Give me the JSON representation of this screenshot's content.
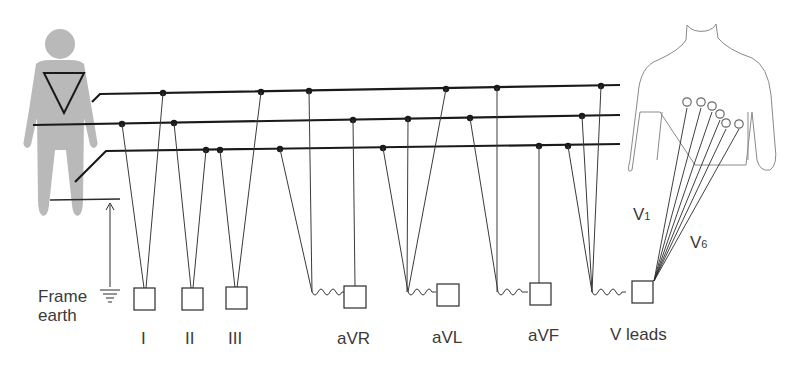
{
  "diagram": {
    "frame_earth": {
      "line1": "Frame",
      "line2": "earth"
    },
    "leads": [
      {
        "id": "I",
        "label": "I"
      },
      {
        "id": "II",
        "label": "II"
      },
      {
        "id": "III",
        "label": "III"
      },
      {
        "id": "aVR",
        "label": "aVR"
      },
      {
        "id": "aVL",
        "label": "aVL"
      },
      {
        "id": "aVF",
        "label": "aVF"
      },
      {
        "id": "V",
        "label": "V leads"
      }
    ],
    "chest_labels": {
      "v1": {
        "main": "V",
        "sub": "1"
      },
      "v6": {
        "main": "V",
        "sub": "6"
      }
    },
    "colors": {
      "figure_fill": "#b9b9b9",
      "line": "#1a1a1a",
      "thin_line": "#3a3a3a",
      "text": "#3a3a3a",
      "torso_outline": "#8a8a8a"
    },
    "bus_lines": [
      "right-arm bus (top)",
      "left-arm bus (middle)",
      "left-leg bus (bottom)"
    ],
    "chest_electrodes_count": 6
  }
}
